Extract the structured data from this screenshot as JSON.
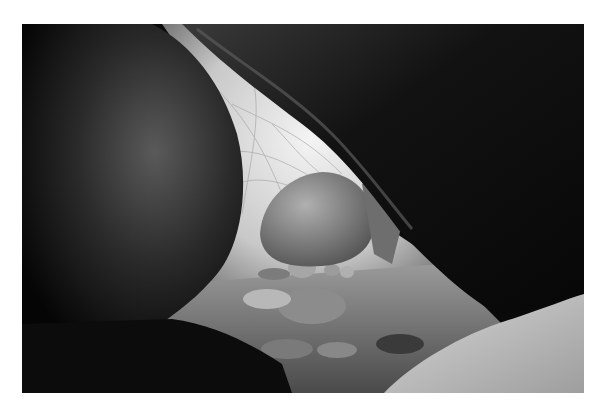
{
  "image": {
    "alt": "Black and white photograph looking out from inside a rock shelter between large boulders toward bright brush and a rounded boulder on a sandy, pebbly floor",
    "tone": "monochrome",
    "colors": {
      "background": "#ffffff",
      "shadow": "#060606",
      "highlight": "#f2f2f2",
      "midtone": "#8a8a8a"
    }
  }
}
